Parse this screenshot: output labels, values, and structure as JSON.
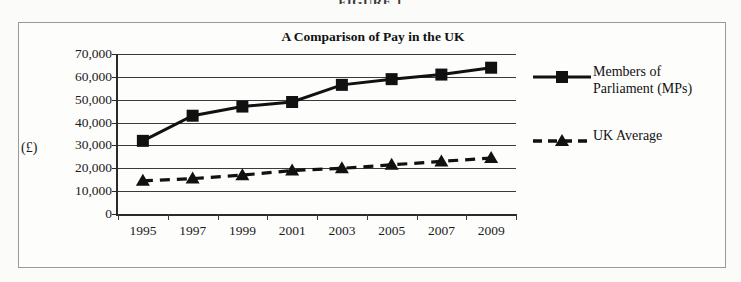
{
  "top_caption": "FIGURE 1",
  "figure": {
    "title": "A Comparison of Pay in the UK",
    "y_axis_title": "(£)"
  },
  "legend": {
    "items": [
      {
        "label": "Members of\nParliament (MPs)",
        "marker": "square",
        "line": "solid",
        "color": "#111111"
      },
      {
        "label": "UK Average",
        "marker": "triangle",
        "line": "dashed",
        "color": "#111111"
      }
    ]
  },
  "chart_data": {
    "type": "line",
    "title": "A Comparison of Pay in the UK",
    "xlabel": "",
    "ylabel": "(£)",
    "ylim": [
      0,
      70000
    ],
    "ytick_labels": [
      "0",
      "10,000",
      "20,000",
      "30,000",
      "40,000",
      "50,000",
      "60,000",
      "70,000"
    ],
    "ytick_values": [
      0,
      10000,
      20000,
      30000,
      40000,
      50000,
      60000,
      70000
    ],
    "grid": true,
    "legend_position": "right",
    "categories": [
      "1995",
      "1997",
      "1999",
      "2001",
      "2003",
      "2005",
      "2007",
      "2009"
    ],
    "x": [
      1995,
      1997,
      1999,
      2001,
      2003,
      2005,
      2007,
      2009
    ],
    "series": [
      {
        "name": "Members of Parliament (MPs)",
        "marker": "square",
        "line": "solid",
        "color": "#111111",
        "values": [
          32000,
          43000,
          47000,
          49000,
          56500,
          59000,
          61000,
          64000
        ]
      },
      {
        "name": "UK Average",
        "marker": "triangle",
        "line": "dashed",
        "color": "#111111",
        "values": [
          14500,
          15500,
          17000,
          19000,
          20000,
          21500,
          23000,
          24500
        ]
      }
    ]
  }
}
